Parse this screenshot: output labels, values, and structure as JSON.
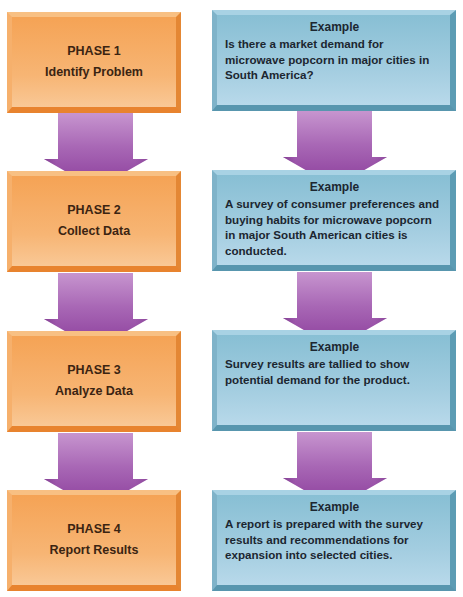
{
  "diagram": {
    "type": "flowchart",
    "colors": {
      "phase_box": "#f39a4a",
      "example_box": "#8cc0d8",
      "arrow": "#9b4fa8",
      "text": "#2a1c10"
    },
    "phases": [
      {
        "title": "PHASE 1",
        "name": "Identify Problem"
      },
      {
        "title": "PHASE 2",
        "name": "Collect Data"
      },
      {
        "title": "PHASE 3",
        "name": "Analyze Data"
      },
      {
        "title": "PHASE 4",
        "name": "Report Results"
      }
    ],
    "examples": [
      {
        "heading": "Example",
        "text": "Is there a market demand for microwave popcorn in major cities in South America?"
      },
      {
        "heading": "Example",
        "text": "A survey of consumer preferences and buying habits for microwave popcorn in major South American cities is conducted."
      },
      {
        "heading": "Example",
        "text": "Survey results are tallied to show potential demand for the product."
      },
      {
        "heading": "Example",
        "text": "A report is prepared with the survey results and recommendations for expansion into selected cities."
      }
    ],
    "arrows": [
      {
        "icon": "down-arrow-icon",
        "column": "phases",
        "from": "PHASE 1",
        "to": "PHASE 2"
      },
      {
        "icon": "down-arrow-icon",
        "column": "phases",
        "from": "PHASE 2",
        "to": "PHASE 3"
      },
      {
        "icon": "down-arrow-icon",
        "column": "phases",
        "from": "PHASE 3",
        "to": "PHASE 4"
      },
      {
        "icon": "down-arrow-icon",
        "column": "examples",
        "from": "Example 1",
        "to": "Example 2"
      },
      {
        "icon": "down-arrow-icon",
        "column": "examples",
        "from": "Example 2",
        "to": "Example 3"
      },
      {
        "icon": "down-arrow-icon",
        "column": "examples",
        "from": "Example 3",
        "to": "Example 4"
      }
    ]
  }
}
